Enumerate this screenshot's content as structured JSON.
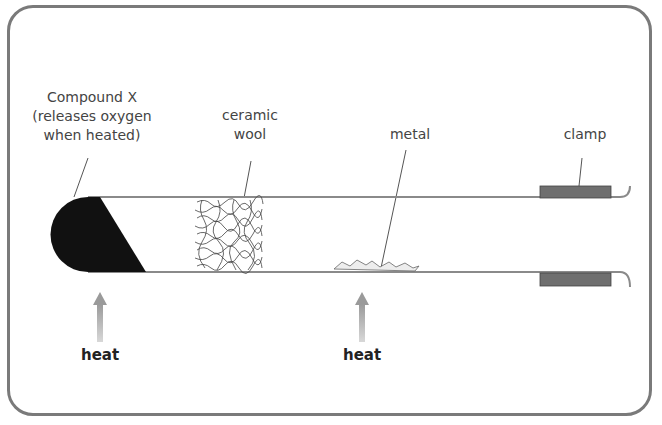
{
  "diagram": {
    "labels": {
      "compound_x": [
        "Compound X",
        "(releases oxygen",
        "when heated)"
      ],
      "ceramic_wool": [
        "ceramic",
        "wool"
      ],
      "metal": "metal",
      "clamp": "clamp"
    },
    "heat_labels": [
      "heat",
      "heat"
    ],
    "icons": [
      "up-arrow-icon",
      "up-arrow-icon"
    ],
    "colors": {
      "frame": "#7a7a7a",
      "tube": "#8a8a8a",
      "compound": "#111111",
      "clamp": "#6f6f6f",
      "arrow": "#a9a9a9"
    }
  }
}
